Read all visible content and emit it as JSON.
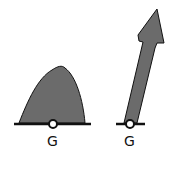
{
  "diagram": {
    "left": {
      "shape": "hump",
      "label": "G",
      "fill": "#6b6b6b",
      "stroke": "#111111"
    },
    "right": {
      "shape": "arrow",
      "label": "G",
      "fill": "#6b6b6b",
      "stroke": "#111111"
    },
    "colors": {
      "background": "#ffffff",
      "baseline": "#111111",
      "point_fill": "#ffffff"
    }
  }
}
